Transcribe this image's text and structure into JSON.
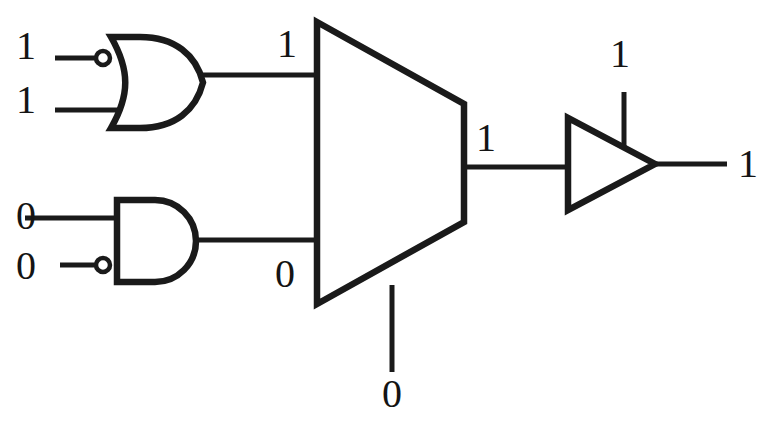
{
  "diagram": {
    "type": "digital-logic-schematic",
    "colors": {
      "ink": "#1a1a1a",
      "background": "#ffffff",
      "label_text": "#141414"
    },
    "gates": [
      {
        "id": "or-gate",
        "kind": "or",
        "label": "OR gate with inverted top input",
        "inverted_inputs": [
          "a"
        ],
        "inputs": [
          "1",
          "1"
        ],
        "output": "1"
      },
      {
        "id": "and-gate",
        "kind": "and",
        "label": "AND gate with inverted bottom input",
        "inverted_inputs": [
          "b"
        ],
        "inputs": [
          "0",
          "0"
        ],
        "output": "0"
      },
      {
        "id": "mux",
        "kind": "multiplexer",
        "label": "2-to-1 multiplexer",
        "data_inputs": [
          "1",
          "0"
        ],
        "select": "0",
        "output": "1"
      },
      {
        "id": "tristate-buffer",
        "kind": "tristate-buffer",
        "label": "Tri-state buffer",
        "enable": "1",
        "output": "1"
      }
    ],
    "labels": {
      "or_input_a": "1",
      "or_input_b": "1",
      "and_input_a": "0",
      "and_input_b": "0",
      "mux_input_top": "1",
      "mux_input_bottom": "0",
      "mux_select": "0",
      "mux_output": "1",
      "buffer_enable": "1",
      "circuit_output": "1"
    }
  }
}
